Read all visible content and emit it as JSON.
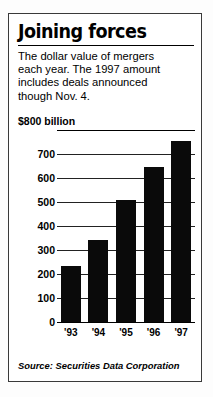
{
  "figure": {
    "headline": "Joining forces",
    "deck_lines": [
      "The dollar value of mergers",
      "each year. The 1997 amount",
      "includes deals announced",
      "though Nov. 4."
    ],
    "source": "Source: Securities Data Corporation",
    "border_color": "#3a3a3a",
    "bar_color": "#0a0a0a"
  },
  "chart_data": {
    "type": "bar",
    "title": "Joining forces",
    "subtitle": "The dollar value of mergers each year. The 1997 amount includes deals announced though Nov. 4.",
    "categories": [
      "'93",
      "'94",
      "'95",
      "'96",
      "'97"
    ],
    "values": [
      235,
      340,
      510,
      645,
      755
    ],
    "xlabel": "",
    "ylabel": "$800 billion",
    "ylim": [
      0,
      800
    ],
    "ytick_labels": [
      "0",
      "100",
      "200",
      "300",
      "400",
      "500",
      "600",
      "700",
      "$800 billion"
    ],
    "ytick_values": [
      0,
      100,
      200,
      300,
      400,
      500,
      600,
      700,
      800
    ],
    "grid": true,
    "legend": "none",
    "source": "Source: Securities Data Corporation",
    "units": "billions of U.S. dollars"
  }
}
